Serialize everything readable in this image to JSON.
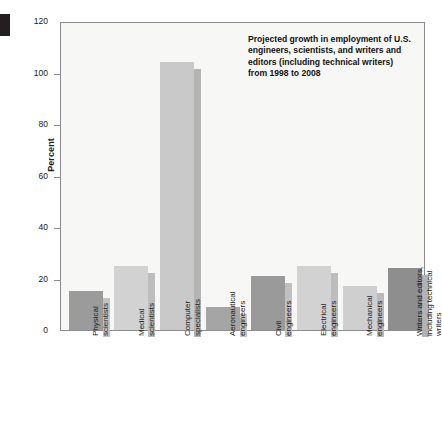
{
  "chart_data": {
    "type": "bar",
    "title": "",
    "annotation": "Projected growth in employment of U.S. engineers, scientists, and writers and editors (including technical writers) from 1998 to 2008",
    "xlabel": "",
    "ylabel": "Percent",
    "ylim": [
      0,
      120
    ],
    "yticks": [
      0,
      20,
      40,
      60,
      80,
      100,
      120
    ],
    "ytick_labels": [
      "0",
      "20",
      "40",
      "60",
      "80",
      "100",
      "120"
    ],
    "grid": false,
    "legend": "none",
    "categories": [
      "Physical scientists",
      "Medical scientists",
      "Computer specialists",
      "Aeronautical engineers",
      "Civil engineers",
      "Electrical engineers",
      "Mechanical engineers",
      "Writers and editors, including technical writers"
    ],
    "category_lines": [
      [
        "Physical",
        "scientists"
      ],
      [
        "Medical",
        "scientists"
      ],
      [
        "Computer",
        "specialists"
      ],
      [
        "Aeronautical",
        "engineers"
      ],
      [
        "Civil",
        "engineers"
      ],
      [
        "Electrical",
        "engineers"
      ],
      [
        "Mechanical",
        "engineers"
      ],
      [
        "Writers and editors,",
        "including technical",
        "writers"
      ]
    ],
    "values": [
      15,
      25,
      104,
      9,
      21,
      25,
      17,
      24
    ],
    "bar_colors": [
      "#9b9b9b",
      "#d2d2d2",
      "#c9c9c9",
      "#a5a5a5",
      "#9a9a9a",
      "#d2d2d2",
      "#cfcfcf",
      "#8e8e8e"
    ],
    "bar_side_colors": [
      "#c3c3c3",
      "#bdbdbd",
      "#b4b4b4",
      "#c3c3c3",
      "#c0c0c0",
      "#bdbdbd",
      "#bababa",
      "#b3b3b3"
    ],
    "plot_background": "#f7f7f6",
    "axis_color": "#8d8d8d"
  }
}
